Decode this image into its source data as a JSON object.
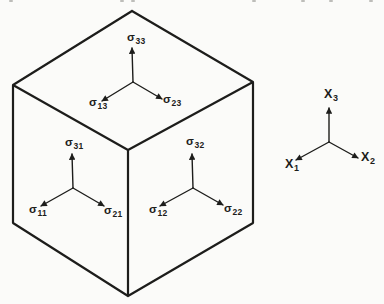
{
  "diagram": {
    "colors": {
      "ink": "#1d1d1b",
      "background": "#fbfbf9"
    },
    "stress_labels": {
      "s33": {
        "symbol": "σ",
        "sub": "33"
      },
      "s13": {
        "symbol": "σ",
        "sub": "13"
      },
      "s23": {
        "symbol": "σ",
        "sub": "23"
      },
      "s31": {
        "symbol": "σ",
        "sub": "31"
      },
      "s11": {
        "symbol": "σ",
        "sub": "11"
      },
      "s21": {
        "symbol": "σ",
        "sub": "21"
      },
      "s32": {
        "symbol": "σ",
        "sub": "32"
      },
      "s12": {
        "symbol": "σ",
        "sub": "12"
      },
      "s22": {
        "symbol": "σ",
        "sub": "22"
      }
    },
    "axis_labels": {
      "x3": {
        "symbol": "X",
        "sub": "3"
      },
      "x1": {
        "symbol": "X",
        "sub": "1"
      },
      "x2": {
        "symbol": "X",
        "sub": "2"
      }
    }
  }
}
